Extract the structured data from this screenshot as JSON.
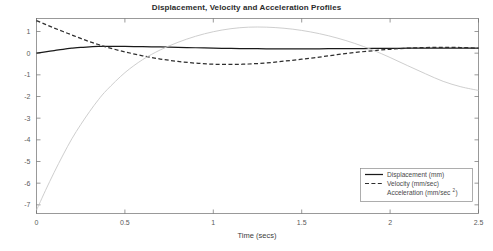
{
  "chart_data": {
    "type": "line",
    "title": "Displacement, Velocity and Acceleration Profiles",
    "xlabel": "Time (secs)",
    "ylabel": "",
    "xlim": [
      0,
      2.5
    ],
    "ylim": [
      -7.4,
      1.6
    ],
    "grid": false,
    "legend_position": "lower right",
    "xticks": [
      0,
      0.5,
      1,
      1.5,
      2,
      2.5
    ],
    "xticklabels": [
      "0",
      "0.5",
      "1",
      "1.5",
      "2",
      "2.5"
    ],
    "yticks": [
      1,
      0,
      -1,
      -2,
      -3,
      -4,
      -5,
      -6,
      -7
    ],
    "yticklabels": [
      "1",
      "0",
      "-1",
      "-2",
      "-3",
      "-4",
      "-5",
      "-6",
      "-7"
    ],
    "x": [
      0,
      0.05,
      0.1,
      0.15,
      0.2,
      0.25,
      0.3,
      0.35,
      0.4,
      0.5,
      0.6,
      0.7,
      0.8,
      0.9,
      1.0,
      1.1,
      1.2,
      1.3,
      1.4,
      1.5,
      1.6,
      1.7,
      1.8,
      1.9,
      2.0,
      2.1,
      2.2,
      2.3,
      2.4,
      2.5
    ],
    "series": [
      {
        "name": "Displacement (mm)",
        "color": "#1a1a1a",
        "style": "solid",
        "values": [
          0.0,
          0.06,
          0.12,
          0.18,
          0.23,
          0.27,
          0.29,
          0.31,
          0.31,
          0.31,
          0.3,
          0.29,
          0.27,
          0.25,
          0.23,
          0.22,
          0.21,
          0.2,
          0.2,
          0.2,
          0.2,
          0.21,
          0.21,
          0.22,
          0.22,
          0.23,
          0.23,
          0.23,
          0.23,
          0.23
        ]
      },
      {
        "name": "Velocity (mm/sec)",
        "color": "#2e2e2e",
        "style": "dashed",
        "values": [
          1.5,
          1.33,
          1.16,
          1.0,
          0.84,
          0.68,
          0.53,
          0.4,
          0.27,
          0.06,
          -0.12,
          -0.27,
          -0.38,
          -0.46,
          -0.51,
          -0.52,
          -0.5,
          -0.45,
          -0.37,
          -0.28,
          -0.18,
          -0.07,
          0.03,
          0.11,
          0.18,
          0.23,
          0.26,
          0.27,
          0.26,
          0.23
        ]
      },
      {
        "name": "Acceleration (mm/sec²)",
        "color": "#c8c8c8",
        "style": "solid",
        "values": [
          -7.25,
          -6.35,
          -5.5,
          -4.7,
          -3.95,
          -3.3,
          -2.7,
          -2.15,
          -1.68,
          -0.9,
          -0.3,
          0.15,
          0.5,
          0.78,
          0.99,
          1.13,
          1.2,
          1.2,
          1.15,
          1.05,
          0.9,
          0.7,
          0.45,
          0.15,
          -0.2,
          -0.58,
          -0.95,
          -1.3,
          -1.55,
          -1.72
        ]
      }
    ]
  },
  "legend": {
    "entries": [
      {
        "label": "Displacement (mm)",
        "style": "solid",
        "color": "#1a1a1a"
      },
      {
        "label": "Velocity (mm/sec)",
        "style": "dashed",
        "color": "#2e2e2e"
      },
      {
        "label": "Acceleration (mm/sec",
        "suffix": ")",
        "superscript": "2",
        "style": "solid",
        "color": "#c8c8c8"
      }
    ]
  }
}
